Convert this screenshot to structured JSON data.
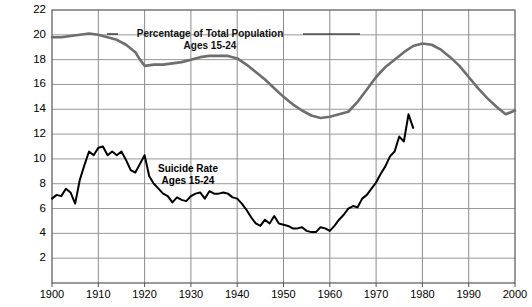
{
  "figure": {
    "clipped_caption": "Suicide Rate vs. Percentage of Population",
    "background_color": "#ffffff",
    "frame_color": "#555555",
    "grid_color": "#8c8c8c"
  },
  "annotations": {
    "population": {
      "line1": "Percentage of Total Population",
      "line2": "Ages 15-24",
      "color": "#000000"
    },
    "suicide": {
      "line1": "Suicide Rate",
      "line2": "Ages 15-24",
      "color": "#000000"
    }
  },
  "axes": {
    "y_ticks": [
      "2",
      "4",
      "6",
      "8",
      "10",
      "12",
      "14",
      "16",
      "18",
      "20",
      "22"
    ],
    "x_ticks": [
      "1900",
      "1910",
      "1920",
      "1930",
      "1940",
      "1950",
      "1960",
      "1970",
      "1980",
      "1990",
      "2000"
    ]
  },
  "chart_data": {
    "type": "line",
    "title": "",
    "subtitle": "",
    "xlabel": "",
    "ylabel": "",
    "xlim": [
      1900,
      2000
    ],
    "ylim": [
      0,
      22
    ],
    "grid": true,
    "legend_position": "inline-annotation",
    "x_tick_values": [
      1900,
      1910,
      1920,
      1930,
      1940,
      1950,
      1960,
      1970,
      1980,
      1990,
      2000
    ],
    "y_tick_values": [
      2,
      4,
      6,
      8,
      10,
      12,
      14,
      16,
      18,
      20,
      22
    ],
    "series": [
      {
        "name": "Percentage of Total Population Ages 15-24",
        "color": "#6e6e6e",
        "width": 2.6,
        "x": [
          1900,
          1902,
          1904,
          1906,
          1908,
          1910,
          1912,
          1914,
          1916,
          1918,
          1919,
          1920,
          1922,
          1924,
          1926,
          1928,
          1930,
          1932,
          1934,
          1936,
          1938,
          1940,
          1942,
          1944,
          1946,
          1948,
          1950,
          1952,
          1954,
          1956,
          1958,
          1960,
          1962,
          1964,
          1966,
          1968,
          1970,
          1972,
          1974,
          1976,
          1978,
          1980,
          1982,
          1984,
          1986,
          1988,
          1990,
          1992,
          1994,
          1996,
          1998,
          2000
        ],
        "values": [
          19.8,
          19.8,
          19.9,
          20.0,
          20.1,
          20.0,
          19.8,
          19.6,
          19.2,
          18.6,
          18.0,
          17.5,
          17.6,
          17.6,
          17.7,
          17.8,
          18.0,
          18.2,
          18.3,
          18.3,
          18.3,
          18.1,
          17.6,
          17.0,
          16.4,
          15.7,
          15.0,
          14.4,
          13.9,
          13.5,
          13.3,
          13.4,
          13.6,
          13.8,
          14.6,
          15.6,
          16.6,
          17.4,
          18.0,
          18.6,
          19.1,
          19.3,
          19.2,
          18.8,
          18.2,
          17.5,
          16.6,
          15.7,
          14.9,
          14.2,
          13.6,
          13.9
        ]
      },
      {
        "name": "Suicide Rate Ages 15-24",
        "color": "#000000",
        "width": 2.0,
        "x": [
          1900,
          1901,
          1902,
          1903,
          1904,
          1905,
          1906,
          1907,
          1908,
          1909,
          1910,
          1911,
          1912,
          1913,
          1914,
          1915,
          1916,
          1917,
          1918,
          1919,
          1920,
          1921,
          1922,
          1923,
          1924,
          1925,
          1926,
          1927,
          1928,
          1929,
          1930,
          1931,
          1932,
          1933,
          1934,
          1935,
          1936,
          1937,
          1938,
          1939,
          1940,
          1941,
          1942,
          1943,
          1944,
          1945,
          1946,
          1947,
          1948,
          1949,
          1950,
          1951,
          1952,
          1953,
          1954,
          1955,
          1956,
          1957,
          1958,
          1959,
          1960,
          1961,
          1962,
          1963,
          1964,
          1965,
          1966,
          1967,
          1968,
          1969,
          1970,
          1971,
          1972,
          1973,
          1974,
          1975,
          1976,
          1977,
          1978
        ],
        "values": [
          6.8,
          7.1,
          7.0,
          7.6,
          7.3,
          6.4,
          8.3,
          9.5,
          10.6,
          10.3,
          10.9,
          11.0,
          10.3,
          10.6,
          10.3,
          10.6,
          9.9,
          9.1,
          8.9,
          9.6,
          10.3,
          8.6,
          8.0,
          7.6,
          7.2,
          7.0,
          6.5,
          6.9,
          6.7,
          6.6,
          7.0,
          7.2,
          7.3,
          6.8,
          7.4,
          7.2,
          7.2,
          7.3,
          7.2,
          6.9,
          6.8,
          6.4,
          5.9,
          5.3,
          4.8,
          4.6,
          5.1,
          4.8,
          5.4,
          4.8,
          4.7,
          4.6,
          4.4,
          4.4,
          4.5,
          4.2,
          4.1,
          4.1,
          4.5,
          4.4,
          4.2,
          4.6,
          5.1,
          5.5,
          6.0,
          6.2,
          6.1,
          6.8,
          7.1,
          7.6,
          8.1,
          8.8,
          9.4,
          10.2,
          10.6,
          11.8,
          11.4,
          13.6,
          12.5
        ]
      }
    ]
  }
}
